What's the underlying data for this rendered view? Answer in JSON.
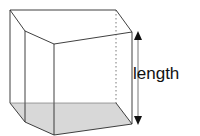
{
  "diagram": {
    "type": "prism",
    "labels": {
      "length": "length"
    },
    "colors": {
      "edge": "#2a2a2a",
      "base_fill": "#d8d8d8",
      "arrow": "#111111",
      "background": "#ffffff"
    }
  }
}
